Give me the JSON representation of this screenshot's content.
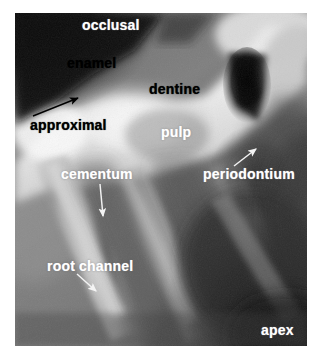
{
  "figure": {
    "type": "annotated-dental-radiograph",
    "background_color": "#ffffff",
    "plate": {
      "x": 15,
      "y": 13,
      "width": 292,
      "height": 333,
      "tone_range": [
        "#0a0a0a",
        "#ffffff"
      ]
    }
  },
  "labels": {
    "occlusal": {
      "text": "occlusal",
      "color": "#ffffff",
      "x": 82,
      "y": 18
    },
    "enamel": {
      "text": "enamel",
      "color": "#000000",
      "x": 67,
      "y": 56
    },
    "dentine": {
      "text": "dentine",
      "color": "#000000",
      "x": 149,
      "y": 82
    },
    "approximal": {
      "text": "approximal",
      "color": "#000000",
      "x": 30,
      "y": 118
    },
    "pulp": {
      "text": "pulp",
      "color": "#ffffff",
      "x": 161,
      "y": 125
    },
    "cementum": {
      "text": "cementum",
      "color": "#ffffff",
      "x": 61,
      "y": 167
    },
    "periodontium": {
      "text": "periodontium",
      "color": "#ffffff",
      "x": 203,
      "y": 167
    },
    "root_channel": {
      "text": "root channel",
      "color": "#ffffff",
      "x": 47,
      "y": 259
    },
    "apex": {
      "text": "apex",
      "color": "#ffffff",
      "x": 261,
      "y": 323
    }
  },
  "arrows": [
    {
      "name": "approximal-arrow",
      "color": "#000000",
      "from_x": 33,
      "from_y": 116,
      "to_x": 78,
      "to_y": 98
    },
    {
      "name": "cementum-arrow",
      "color": "#f2f2f2",
      "from_x": 100,
      "from_y": 184,
      "to_x": 103,
      "to_y": 216
    },
    {
      "name": "periodontium-arrow",
      "color": "#f2f2f2",
      "from_x": 234,
      "from_y": 166,
      "to_x": 256,
      "to_y": 149
    },
    {
      "name": "root-channel-arrow",
      "color": "#f2f2f2",
      "from_x": 77,
      "from_y": 274,
      "to_x": 96,
      "to_y": 291
    }
  ]
}
